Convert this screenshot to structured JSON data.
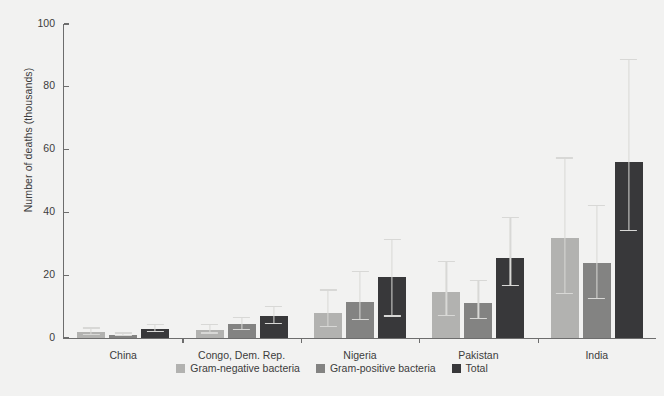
{
  "chart_data": {
    "type": "bar",
    "title": "",
    "subtitle": "",
    "xlabel": "",
    "ylabel": "Number of deaths (thousands)",
    "ylim": [
      0,
      100
    ],
    "yticks": [
      0,
      20,
      40,
      60,
      80,
      100
    ],
    "grid": false,
    "legend_position": "bottom-center",
    "categories": [
      "China",
      "Congo, Dem. Rep.",
      "Nigeria",
      "Pakistan",
      "India"
    ],
    "series": [
      {
        "name": "Gram-negative bacteria",
        "color": "#b2b2b0",
        "values": [
          2.0,
          2.5,
          8.0,
          14.5,
          32.0
        ],
        "error_low": [
          1.0,
          1.4,
          3.6,
          7.0,
          14.0
        ],
        "error_high": [
          3.4,
          4.4,
          15.5,
          24.5,
          57.5
        ]
      },
      {
        "name": "Gram-positive bacteria",
        "color": "#838382",
        "values": [
          1.0,
          4.5,
          11.5,
          11.0,
          24.0
        ],
        "error_low": [
          0.5,
          2.6,
          5.6,
          6.0,
          12.5
        ],
        "error_high": [
          1.8,
          6.6,
          21.5,
          18.5,
          42.5
        ]
      },
      {
        "name": "Total",
        "color": "#38383a",
        "values": [
          3.0,
          7.0,
          19.5,
          25.5,
          56.0
        ],
        "error_low": [
          1.9,
          4.4,
          6.8,
          16.5,
          34.0
        ],
        "error_high": [
          4.6,
          10.2,
          31.5,
          38.5,
          89.0
        ]
      }
    ],
    "errorbar_color": "#d8d8d6"
  },
  "legend": {
    "items": [
      {
        "label": "Gram-negative bacteria",
        "color": "#b2b2b0"
      },
      {
        "label": "Gram-positive bacteria",
        "color": "#838382"
      },
      {
        "label": "Total",
        "color": "#38383a"
      }
    ]
  },
  "colors": {
    "background": "#f2f2f1",
    "axis": "#6d6d6d",
    "text": "#3c3c3c",
    "errorbar": "#d8d8d6"
  }
}
